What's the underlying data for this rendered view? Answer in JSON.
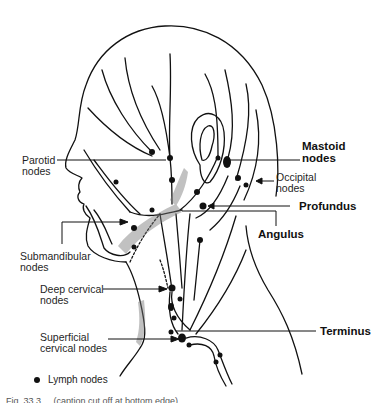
{
  "figure": {
    "type": "anatomical-illustration",
    "colors": {
      "line": "#111111",
      "background": "#ffffff",
      "stipple": "#888888"
    }
  },
  "labels": {
    "parotid": {
      "line1": "Parotid",
      "line2": "nodes"
    },
    "mastoid": {
      "line1": "Mastoid",
      "line2": "nodes"
    },
    "occipital": {
      "line1": "Occipital",
      "line2": "nodes"
    },
    "profundus": "Profundus",
    "angulus": "Angulus",
    "submandibular": {
      "line1": "Submandibular",
      "line2": "nodes"
    },
    "deep_cervical": {
      "line1": "Deep cervical",
      "line2": "nodes"
    },
    "superficial_cervical": {
      "line1": "Superficial",
      "line2": "cervical nodes"
    },
    "terminus": "Terminus"
  },
  "legend": {
    "symbol": "filled-circle",
    "label": "Lymph nodes"
  },
  "caption": "Fig. 33.3 ... (caption cut off at bottom edge)"
}
